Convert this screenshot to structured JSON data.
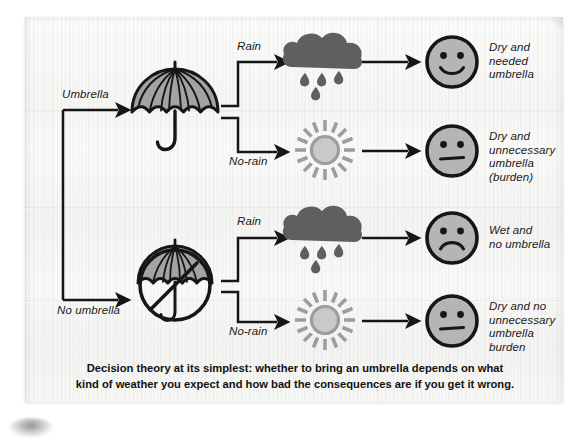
{
  "diagram": {
    "type": "decision-tree",
    "title": "Decision theory at its simplest",
    "decisions": [
      {
        "id": "umbrella",
        "label": "Umbrella",
        "icon": "umbrella-icon"
      },
      {
        "id": "no-umbrella",
        "label": "No umbrella",
        "icon": "no-umbrella-icon"
      }
    ],
    "branches": [
      {
        "decision": "Umbrella",
        "condition": "Rain",
        "weather_icon": "rain-cloud-icon",
        "face_icon": "happy-face-icon",
        "outcome": "Dry and needed umbrella"
      },
      {
        "decision": "Umbrella",
        "condition": "No-rain",
        "weather_icon": "sun-icon",
        "face_icon": "neutral-face-icon",
        "outcome": "Dry and unnecessary umbrella (burden)"
      },
      {
        "decision": "No umbrella",
        "condition": "Rain",
        "weather_icon": "rain-cloud-icon",
        "face_icon": "sad-face-icon",
        "outcome": "Wet and no umbrella"
      },
      {
        "decision": "No umbrella",
        "condition": "No-rain",
        "weather_icon": "sun-icon",
        "face_icon": "neutral-face-icon",
        "outcome": "Dry and no unnecessary umbrella burden"
      }
    ],
    "labels": {
      "umbrella": "Umbrella",
      "no_umbrella": "No umbrella",
      "rain_1": "Rain",
      "norain_1": "No-rain",
      "rain_2": "Rain",
      "norain_2": "No-rain"
    },
    "outcomes": {
      "o1_line1": "Dry and",
      "o1_line2": "needed",
      "o1_line3": "umbrella",
      "o2_line1": "Dry and",
      "o2_line2": "unnecessary",
      "o2_line3": "umbrella",
      "o2_line4": "(burden)",
      "o3_line1": "Wet and",
      "o3_line2": "no umbrella",
      "o4_line1": "Dry and no",
      "o4_line2": "unnecessary",
      "o4_line3": "umbrella",
      "o4_line4": "burden"
    },
    "caption": {
      "line1": "Decision theory at its simplest: whether to bring an umbrella depends on what",
      "line2": "kind of weather you expect and how bad the consequences are if you get it wrong."
    },
    "colors": {
      "ink": "#161616",
      "paper": "#f7f7f6",
      "cloud_gray": "#5f5f5f",
      "sun_gray": "#9d9d9d",
      "fill_gray": "#a3a3a3",
      "face_fill": "#b0b0b0"
    }
  }
}
